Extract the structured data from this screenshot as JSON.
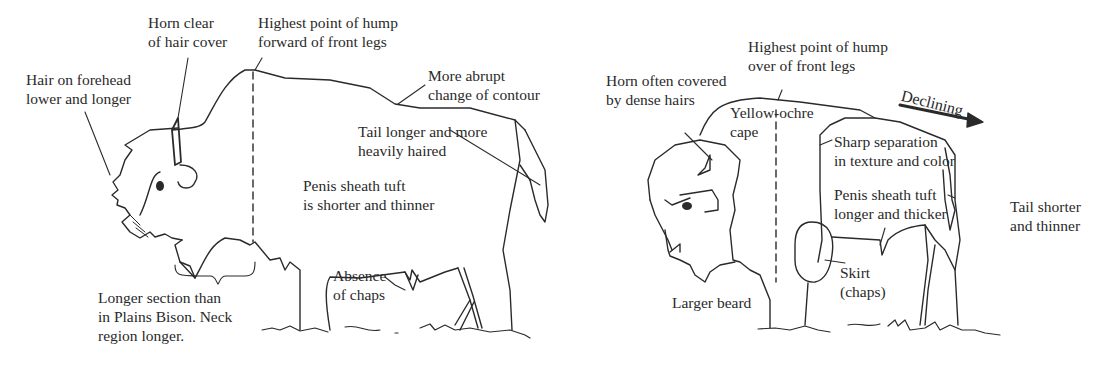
{
  "figure": {
    "panels": [
      {
        "id": "left",
        "subject": "bison",
        "labels": {
          "horn": [
            "Horn clear",
            "of hair cover"
          ],
          "forehead": [
            "Hair on forehead",
            "lower and longer"
          ],
          "hump": [
            "Highest point of hump",
            "forward of front legs"
          ],
          "contour": [
            "More abrupt",
            "change of contour"
          ],
          "tail": [
            "Tail longer and more",
            "heavily haired"
          ],
          "sheath": [
            "Penis sheath tuft",
            "is shorter and thinner"
          ],
          "chaps": [
            "Absence",
            "of chaps"
          ],
          "neck": [
            "Longer section than",
            "in Plains Bison. Neck",
            "region longer."
          ]
        }
      },
      {
        "id": "right",
        "subject": "bison",
        "labels": {
          "horn": [
            "Horn often covered",
            "by dense hairs"
          ],
          "hump": [
            "Highest point of hump",
            "over of front legs"
          ],
          "cape": [
            "Yellow-ochre",
            "cape"
          ],
          "declining": "Declining",
          "separation": [
            "Sharp separation",
            "in texture and color"
          ],
          "sheath": [
            "Penis sheath tuft",
            "longer and thicker"
          ],
          "tail": [
            "Tail shorter",
            "and thinner"
          ],
          "skirt": [
            "Skirt",
            "(chaps)"
          ],
          "beard": "Larger beard"
        }
      }
    ],
    "colors": {
      "line": "#2a2a2a",
      "background": "#ffffff"
    }
  }
}
